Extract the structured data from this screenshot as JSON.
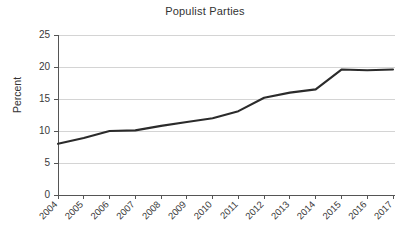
{
  "chart_data": {
    "type": "line",
    "title": "Populist Parties",
    "xlabel": "",
    "ylabel": "Percent",
    "categories": [
      "2004",
      "2005",
      "2006",
      "2007",
      "2008",
      "2009",
      "2010",
      "2011",
      "2012",
      "2013",
      "2014",
      "2015",
      "2016",
      "2017"
    ],
    "values": [
      8.0,
      8.9,
      10.0,
      10.1,
      10.8,
      11.4,
      12.0,
      13.1,
      15.2,
      16.0,
      16.5,
      19.6,
      19.5,
      19.6
    ],
    "series": [
      {
        "name": "Populist Parties",
        "values": [
          8.0,
          8.9,
          10.0,
          10.1,
          10.8,
          11.4,
          12.0,
          13.1,
          15.2,
          16.0,
          16.5,
          19.6,
          19.5,
          19.6
        ],
        "color": "#2b2b2b"
      }
    ],
    "ylim": [
      0,
      25
    ],
    "yticks": [
      0,
      5,
      10,
      15,
      20,
      25
    ],
    "ytick_labels": [
      "0",
      "5",
      "10",
      "15",
      "20",
      "25"
    ],
    "grid": true,
    "grid_axis": "y",
    "legend": false,
    "legend_position": "none",
    "xtick_rotation": 45,
    "line_color": "#2b2b2b",
    "grid_color": "#d4d4d4",
    "axis_color": "#555555",
    "background_color": "#ffffff"
  }
}
